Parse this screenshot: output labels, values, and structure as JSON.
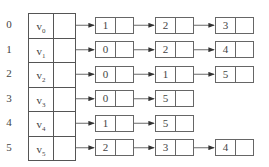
{
  "diagram": {
    "type": "adjacency-list",
    "vertices": [
      {
        "index": "0",
        "label": "v",
        "sub": "0",
        "adj": [
          "1",
          "2",
          "3"
        ]
      },
      {
        "index": "1",
        "label": "v",
        "sub": "1",
        "adj": [
          "0",
          "2",
          "4"
        ]
      },
      {
        "index": "2",
        "label": "v",
        "sub": "2",
        "adj": [
          "0",
          "1",
          "5"
        ]
      },
      {
        "index": "3",
        "label": "v",
        "sub": "3",
        "adj": [
          "0",
          "5"
        ]
      },
      {
        "index": "4",
        "label": "v",
        "sub": "4",
        "adj": [
          "1",
          "5"
        ]
      },
      {
        "index": "5",
        "label": "v",
        "sub": "5",
        "adj": [
          "2",
          "3",
          "4"
        ]
      }
    ]
  }
}
